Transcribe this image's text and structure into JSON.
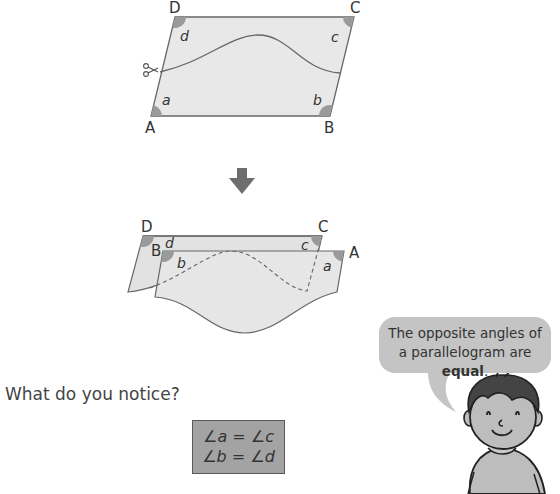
{
  "figure_original": {
    "vertices": {
      "A": "A",
      "B": "B",
      "C": "C",
      "D": "D"
    },
    "angles": {
      "a": "a",
      "b": "b",
      "c": "c",
      "d": "d"
    },
    "icon": "scissors-icon"
  },
  "arrow": {
    "icon": "arrow-down-icon"
  },
  "figure_rearranged": {
    "vertices": {
      "D": "D",
      "C": "C",
      "B": "B",
      "A": "A"
    },
    "angles": {
      "d": "d",
      "c": "c",
      "b": "b",
      "a": "a"
    }
  },
  "question": "What do you notice?",
  "answer": {
    "line1": "∠a = ∠c",
    "line2": "∠b = ∠d"
  },
  "speech_bubble": {
    "text_before": "The opposite angles of a parallelogram are ",
    "text_bold": "equal",
    "text_after": "."
  },
  "colors": {
    "shape_fill": "#e6e6e6",
    "angle_fill": "#9a9a9a",
    "line": "#666666",
    "arrow": "#6e6e6e",
    "answer_fill": "#a3a3a3",
    "bubble_fill": "#c4c4c4"
  }
}
